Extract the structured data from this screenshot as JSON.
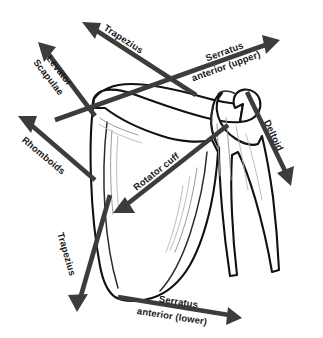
{
  "figure": {
    "background_color": "#ffffff",
    "arrow_color": "#3c3c3c",
    "bone_outline_color": "#111111",
    "label_color": "#1a1a1a"
  },
  "labels": {
    "trapezius_upper": "Trapezius",
    "levator_scapulae_line1": "Levator",
    "levator_scapulae_line2": "Scapulae",
    "rhomboids": "Rhomboids",
    "trapezius_lower": "Trapezius",
    "serratus_upper_line1": "Serratus",
    "serratus_upper_line2": "anterior (upper)",
    "deltoid": "Deltoid",
    "rotator_cuff": "Rotator cuff",
    "serratus_lower_line1": "Serratus",
    "serratus_lower_line2": "anterior (lower)"
  },
  "vectors": [
    {
      "id": "trapezius-upper",
      "name": "Trapezius",
      "direction": "up-left",
      "tail": [
        196,
        95
      ],
      "tip": [
        82,
        22
      ],
      "angle_deg": -147
    },
    {
      "id": "levator-scapulae",
      "name": "Levator Scapulae",
      "direction": "up-left",
      "tail": [
        95,
        116
      ],
      "tip": [
        38,
        42
      ],
      "angle_deg": -128
    },
    {
      "id": "rhomboids",
      "name": "Rhomboids",
      "direction": "up-left",
      "tail": [
        95,
        180
      ],
      "tip": [
        18,
        116
      ],
      "angle_deg": -140
    },
    {
      "id": "trapezius-lower",
      "name": "Trapezius",
      "direction": "down-left",
      "tail": [
        110,
        195
      ],
      "tip": [
        77,
        312
      ],
      "angle_deg": 106
    },
    {
      "id": "serratus-anterior-upper",
      "name": "Serratus anterior (upper)",
      "direction": "up-right",
      "tail": [
        55,
        120
      ],
      "tip": [
        280,
        40
      ],
      "angle_deg": -20
    },
    {
      "id": "deltoid",
      "name": "Deltoid",
      "direction": "down-right",
      "tail": [
        247,
        92
      ],
      "tip": [
        291,
        186
      ],
      "angle_deg": 65
    },
    {
      "id": "rotator-cuff",
      "name": "Rotator cuff",
      "direction": "down-left",
      "tail": [
        228,
        125
      ],
      "tip": [
        113,
        213
      ],
      "angle_deg": 143
    },
    {
      "id": "serratus-anterior-lower",
      "name": "Serratus anterior (lower)",
      "direction": "down-right",
      "tail": [
        118,
        297
      ],
      "tip": [
        242,
        318
      ],
      "angle_deg": 10
    }
  ]
}
